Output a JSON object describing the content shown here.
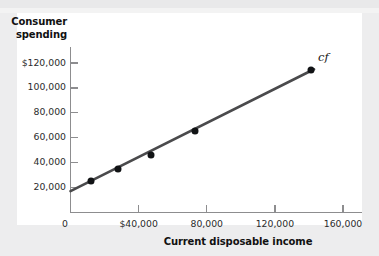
{
  "chart_data": {
    "type": "scatter",
    "title": "",
    "xlabel": "Current disposable income",
    "ylabel_line1": "Consumer",
    "ylabel_line2": "spending",
    "series_label": "cf",
    "grid": false,
    "legend": "none",
    "xlim": [
      0,
      172000
    ],
    "ylim": [
      0,
      130000
    ],
    "x_ticks": [
      40000,
      80000,
      120000,
      160000
    ],
    "x_tick_labels": [
      "$40,000",
      "80,000",
      "120,000",
      "160,000"
    ],
    "origin_label": "0",
    "y_ticks": [
      20000,
      40000,
      60000,
      80000,
      100000,
      120000
    ],
    "y_tick_labels": [
      "20,000",
      "40,000",
      "60,000",
      "80,000",
      "100,000",
      "$120,000"
    ],
    "points": [
      {
        "x": 12000,
        "y": 25000
      },
      {
        "x": 28000,
        "y": 35000
      },
      {
        "x": 47000,
        "y": 46000
      },
      {
        "x": 73000,
        "y": 65000
      },
      {
        "x": 141000,
        "y": 114000
      }
    ],
    "fit_line": {
      "intercept": 17000,
      "slope": 0.685,
      "x_start": 0,
      "x_end": 143000,
      "color": "#4a4a4c"
    },
    "point_color": "#111315",
    "axis_color": "#8d8d8f",
    "background_color": "#ffffff",
    "page_background": "#ededee"
  }
}
